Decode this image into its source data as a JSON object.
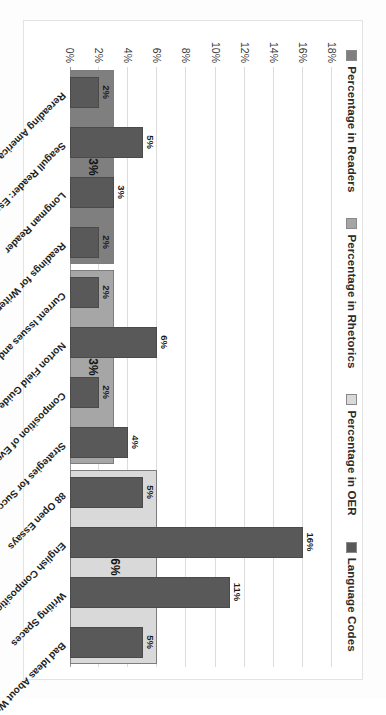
{
  "chart_data": {
    "type": "bar",
    "title": "",
    "subtitle": "",
    "xlabel": "",
    "ylabel": "",
    "ylim": [
      0,
      18
    ],
    "ytick_labels": [
      "18%",
      "16%",
      "14%",
      "12%",
      "10%",
      "8%",
      "6%",
      "4%",
      "2%",
      "0%"
    ],
    "ytick_values": [
      18,
      16,
      14,
      12,
      10,
      8,
      6,
      4,
      2,
      0
    ],
    "grid": true,
    "legend_position": "top",
    "legend": [
      {
        "label": "Percentage in Readers",
        "color": "#7f7f7f"
      },
      {
        "label": "Percentage in Rhetorics",
        "color": "#a6a6a6"
      },
      {
        "label": "Percentage in OER",
        "color": "#d9d9d9"
      },
      {
        "label": "Language Codes",
        "color": "#595959"
      }
    ],
    "categories": [
      "Rereading America",
      "Seagull Reader: Essays",
      "Longman Reader",
      "Readings for Writers",
      "Current Issues and Enduring Questions",
      "Norton Field Guide to Writing with Readings",
      "Composition of Everyday Life",
      "Strategies for Successful Writing",
      "88 Open Essays",
      "English Composition 1: Rhetorical Methods...",
      "Writing Spaces",
      "Bad Ideas About Writing"
    ],
    "series": [
      {
        "name": "Language Codes",
        "color": "#595959",
        "values": [
          2,
          5,
          3,
          2,
          2,
          6,
          2,
          4,
          5,
          16,
          11,
          5
        ],
        "value_labels": [
          "2%",
          "5%",
          "3%",
          "2%",
          "2%",
          "6%",
          "2%",
          "4%",
          "5%",
          "16%",
          "11%",
          "5%"
        ]
      }
    ],
    "group_bars": [
      {
        "name": "Percentage in Readers",
        "color": "#7f7f7f",
        "value": 3,
        "label": "3%",
        "span_categories": [
          "Rereading America",
          "Seagull Reader: Essays",
          "Longman Reader",
          "Readings for Writers"
        ]
      },
      {
        "name": "Percentage in Rhetorics",
        "color": "#a6a6a6",
        "value": 3,
        "label": "3%",
        "span_categories": [
          "Current Issues and Enduring Questions",
          "Norton Field Guide to Writing with Readings",
          "Composition of Everyday Life",
          "Strategies for Successful Writing"
        ]
      },
      {
        "name": "Percentage in OER",
        "color": "#d9d9d9",
        "value": 6,
        "label": "6%",
        "span_categories": [
          "88 Open Essays",
          "English Composition 1: Rhetorical Methods...",
          "Writing Spaces",
          "Bad Ideas About Writing"
        ]
      }
    ]
  }
}
